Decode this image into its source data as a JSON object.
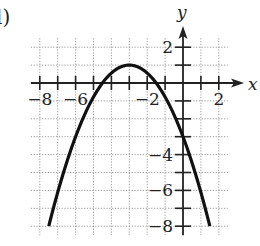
{
  "problem_label": "l)",
  "chart_data": {
    "type": "line",
    "title": "",
    "xlabel": "x",
    "ylabel": "y",
    "xlim": [
      -8.5,
      2.5
    ],
    "ylim": [
      -8.5,
      2.5
    ],
    "grid": true,
    "grid_style": "dotted",
    "x_tick_labels": [
      {
        "value": -8,
        "label": "−8"
      },
      {
        "value": -6,
        "label": "−6"
      },
      {
        "value": -2,
        "label": "−2"
      },
      {
        "value": 2,
        "label": "2"
      }
    ],
    "y_tick_labels": [
      {
        "value": 2,
        "label": "2"
      },
      {
        "value": -4,
        "label": "−4"
      },
      {
        "value": -6,
        "label": "−6"
      },
      {
        "value": -8,
        "label": "−8"
      }
    ],
    "x_ticks": [
      -8,
      -7,
      -6,
      -5,
      -4,
      -3,
      -2,
      -1,
      1,
      2
    ],
    "y_ticks": [
      2,
      1,
      -1,
      -2,
      -3,
      -4,
      -5,
      -6,
      -7,
      -8
    ],
    "series": [
      {
        "name": "parabola",
        "equation": "y = -(4/9)(x+3)^2 + 1",
        "vertex": [
          -3,
          1
        ],
        "x_intercepts": [
          -4.5,
          -1.5
        ],
        "y_intercept": -3,
        "x_range": [
          -7.5,
          1.5
        ],
        "color": "#111111"
      }
    ],
    "colors": {
      "axis": "#222222",
      "grid": "#9a9a9a",
      "curve": "#111111"
    }
  }
}
